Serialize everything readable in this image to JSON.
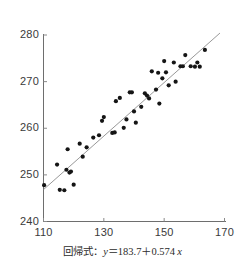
{
  "chart_data": {
    "type": "scatter",
    "title": "",
    "subtitle": "",
    "xlabel": "",
    "ylabel": "",
    "xlim": [
      110,
      170
    ],
    "ylim": [
      240,
      280
    ],
    "xticks": [
      110,
      130,
      150,
      170
    ],
    "yticks": [
      240,
      250,
      260,
      270,
      280
    ],
    "grid": false,
    "legend": null,
    "caption": "回帰式：y＝183.7＋0.574 x",
    "caption_parts": {
      "label": "回帰式：",
      "y_var": "y",
      "equals": "＝",
      "intercept": "183.7",
      "plus": "＋",
      "slope": "0.574",
      "x_var": "x"
    },
    "regression": {
      "type": "line",
      "intercept": 183.7,
      "slope": 0.574,
      "x_start": 110,
      "x_end": 168.5,
      "color": "#8c8c8c"
    },
    "marker": {
      "shape": "circle",
      "color": "#151515",
      "size_px": 4.2
    },
    "series": [
      {
        "name": "observations",
        "points": [
          [
            110.2,
            247.8
          ],
          [
            114.5,
            252.2
          ],
          [
            115.4,
            246.8
          ],
          [
            116.9,
            246.7
          ],
          [
            117.6,
            251.1
          ],
          [
            118.0,
            255.5
          ],
          [
            118.6,
            250.5
          ],
          [
            119.1,
            250.7
          ],
          [
            120.0,
            247.9
          ],
          [
            122.0,
            256.7
          ],
          [
            123.0,
            253.9
          ],
          [
            124.3,
            255.9
          ],
          [
            126.5,
            258.0
          ],
          [
            128.4,
            258.5
          ],
          [
            129.4,
            261.6
          ],
          [
            130.0,
            262.4
          ],
          [
            132.8,
            259.0
          ],
          [
            133.6,
            259.1
          ],
          [
            134.0,
            265.8
          ],
          [
            135.3,
            266.5
          ],
          [
            136.6,
            260.1
          ],
          [
            137.5,
            261.9
          ],
          [
            138.6,
            267.7
          ],
          [
            139.3,
            267.7
          ],
          [
            140.0,
            263.6
          ],
          [
            140.6,
            261.2
          ],
          [
            142.4,
            264.6
          ],
          [
            143.6,
            267.5
          ],
          [
            144.3,
            267.0
          ],
          [
            145.0,
            266.4
          ],
          [
            145.9,
            272.2
          ],
          [
            147.3,
            268.3
          ],
          [
            148.0,
            271.9
          ],
          [
            148.4,
            265.3
          ],
          [
            149.4,
            270.7
          ],
          [
            150.0,
            274.4
          ],
          [
            150.6,
            272.0
          ],
          [
            151.5,
            269.2
          ],
          [
            153.2,
            274.1
          ],
          [
            153.8,
            270.0
          ],
          [
            155.4,
            273.3
          ],
          [
            156.2,
            273.3
          ],
          [
            157.0,
            275.7
          ],
          [
            158.8,
            273.3
          ],
          [
            160.2,
            273.2
          ],
          [
            161.0,
            274.1
          ],
          [
            161.8,
            273.2
          ],
          [
            163.5,
            276.8
          ]
        ]
      }
    ]
  },
  "axes": {
    "x_tick_labels": [
      "110",
      "130",
      "150",
      "170"
    ],
    "y_tick_labels": [
      "240",
      "250",
      "260",
      "270",
      "280"
    ]
  }
}
